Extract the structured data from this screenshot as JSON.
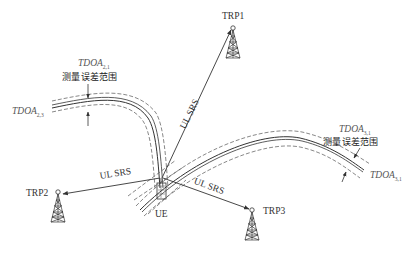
{
  "diagram": {
    "nodes": {
      "trp1": {
        "label": "TRP1"
      },
      "trp2": {
        "label": "TRP2"
      },
      "trp3": {
        "label": "TRP3"
      },
      "ue": {
        "label": "UE"
      }
    },
    "links": [
      {
        "from": "UE",
        "to": "TRP1",
        "label": "UL SRS"
      },
      {
        "from": "UE",
        "to": "TRP2",
        "label": "UL SRS"
      },
      {
        "from": "UE",
        "to": "TRP3",
        "label": "UL SRS"
      }
    ],
    "hyperbolas": [
      {
        "id": "tdoa21",
        "name": "TDOA",
        "subscript": "2,1",
        "error_label": "测量误差范围"
      },
      {
        "id": "tdoa23",
        "name": "TDOA",
        "subscript": "2,3"
      },
      {
        "id": "tdoa31_top",
        "name": "TDOA",
        "subscript": "3,1",
        "error_label": "测量误差范围"
      },
      {
        "id": "tdoa31_right",
        "name": "TDOA",
        "subscript": "3,1"
      }
    ]
  },
  "colors": {
    "line": "#333333",
    "dash": "#555555",
    "text": "#333333"
  }
}
